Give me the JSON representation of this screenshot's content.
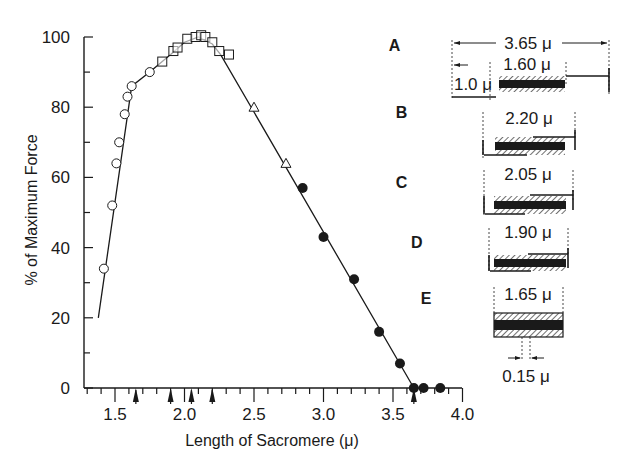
{
  "chart_data": {
    "type": "scatter",
    "title": "",
    "xlabel": "Length of Sacromere (μ)",
    "ylabel": "% of Maximum Force",
    "xlim": [
      1.3,
      4.0
    ],
    "ylim": [
      0,
      100
    ],
    "x_ticks": [
      "1.5",
      "2.0",
      "2.5",
      "3.0",
      "3.5",
      "4.0"
    ],
    "y_ticks": [
      "0",
      "20",
      "40",
      "60",
      "80",
      "100"
    ],
    "grid": false,
    "legend": null,
    "series": [
      {
        "name": "open circles",
        "marker": "circle-open",
        "points": [
          [
            1.42,
            34
          ],
          [
            1.48,
            52
          ],
          [
            1.51,
            64
          ],
          [
            1.53,
            70
          ],
          [
            1.57,
            78
          ],
          [
            1.59,
            83
          ],
          [
            1.62,
            86
          ],
          [
            1.75,
            90
          ]
        ]
      },
      {
        "name": "open squares",
        "marker": "square-open",
        "points": [
          [
            1.84,
            93
          ],
          [
            1.92,
            96
          ],
          [
            1.95,
            97
          ],
          [
            2.02,
            99.5
          ],
          [
            2.08,
            100
          ],
          [
            2.12,
            100.5
          ],
          [
            2.15,
            100
          ],
          [
            2.2,
            98.5
          ],
          [
            2.25,
            96
          ],
          [
            2.32,
            95
          ]
        ]
      },
      {
        "name": "open triangles",
        "marker": "triangle-open",
        "points": [
          [
            2.5,
            80
          ],
          [
            2.73,
            64
          ]
        ]
      },
      {
        "name": "filled circles",
        "marker": "circle-filled",
        "points": [
          [
            2.85,
            57
          ],
          [
            3.0,
            43
          ],
          [
            3.22,
            31
          ],
          [
            3.4,
            16
          ],
          [
            3.55,
            7
          ],
          [
            3.65,
            0
          ],
          [
            3.72,
            0
          ],
          [
            3.84,
            0
          ]
        ]
      }
    ],
    "fit_line": [
      [
        1.38,
        20
      ],
      [
        1.62,
        86
      ],
      [
        1.75,
        90
      ],
      [
        1.9,
        95
      ],
      [
        2.0,
        98.5
      ],
      [
        2.1,
        100
      ],
      [
        2.2,
        98
      ],
      [
        2.26,
        95
      ],
      [
        3.65,
        0
      ]
    ],
    "x_arrows": [
      1.65,
      1.9,
      2.05,
      2.2,
      3.65
    ],
    "region_labels": [
      {
        "label": "A",
        "x": 3.47,
        "y": 96
      },
      {
        "label": "B",
        "x": 3.52,
        "y": 77
      },
      {
        "label": "C",
        "x": 3.52,
        "y": 57
      },
      {
        "label": "D",
        "x": 3.63,
        "y": 40
      },
      {
        "label": "E",
        "x": 3.7,
        "y": 24
      }
    ]
  },
  "diagrams": [
    {
      "id": "A",
      "labels": [
        "3.65 μ",
        "1.60 μ",
        "1.0 μ"
      ]
    },
    {
      "id": "B",
      "labels": [
        "2.20 μ"
      ]
    },
    {
      "id": "C",
      "labels": [
        "2.05 μ"
      ]
    },
    {
      "id": "D",
      "labels": [
        "1.90 μ"
      ]
    },
    {
      "id": "E",
      "labels": [
        "1.65 μ",
        "0.15 μ"
      ]
    }
  ]
}
